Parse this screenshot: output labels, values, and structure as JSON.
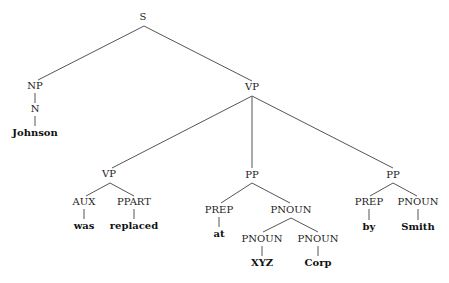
{
  "nodes": [
    {
      "id": "s",
      "label": "S",
      "x": 143,
      "y": 17,
      "type": "category"
    },
    {
      "id": "np",
      "label": "NP",
      "x": 35,
      "y": 86,
      "type": "category"
    },
    {
      "id": "n",
      "label": "N",
      "x": 35,
      "y": 109,
      "type": "category"
    },
    {
      "id": "johnson",
      "label": "Johnson",
      "x": 35,
      "y": 133,
      "type": "word"
    },
    {
      "id": "vp1",
      "label": "VP",
      "x": 252,
      "y": 87,
      "type": "category"
    },
    {
      "id": "vp2",
      "label": "VP",
      "x": 109,
      "y": 174,
      "type": "category"
    },
    {
      "id": "aux",
      "label": "AUX",
      "x": 84,
      "y": 202,
      "type": "category"
    },
    {
      "id": "was",
      "label": "was",
      "x": 84,
      "y": 226,
      "type": "word"
    },
    {
      "id": "ppart",
      "label": "PPART",
      "x": 134,
      "y": 202,
      "type": "category"
    },
    {
      "id": "replaced",
      "label": "replaced",
      "x": 134,
      "y": 226,
      "type": "word"
    },
    {
      "id": "pp1",
      "label": "PP",
      "x": 252,
      "y": 175,
      "type": "category"
    },
    {
      "id": "prep1",
      "label": "PREP",
      "x": 219,
      "y": 210,
      "type": "category"
    },
    {
      "id": "at",
      "label": "at",
      "x": 219,
      "y": 234,
      "type": "word"
    },
    {
      "id": "pnoun1",
      "label": "PNOUN",
      "x": 291,
      "y": 210,
      "type": "category"
    },
    {
      "id": "pnoun2",
      "label": "PNOUN",
      "x": 262,
      "y": 239,
      "type": "category"
    },
    {
      "id": "xyz",
      "label": "XYZ",
      "x": 262,
      "y": 263,
      "type": "word"
    },
    {
      "id": "pnoun3",
      "label": "PNOUN",
      "x": 318,
      "y": 239,
      "type": "category"
    },
    {
      "id": "corp",
      "label": "Corp",
      "x": 318,
      "y": 263,
      "type": "word"
    },
    {
      "id": "pp2",
      "label": "PP",
      "x": 393,
      "y": 175,
      "type": "category"
    },
    {
      "id": "prep2",
      "label": "PREP",
      "x": 369,
      "y": 202,
      "type": "category"
    },
    {
      "id": "by",
      "label": "by",
      "x": 369,
      "y": 227,
      "type": "word"
    },
    {
      "id": "pnoun4",
      "label": "PNOUN",
      "x": 418,
      "y": 202,
      "type": "category"
    },
    {
      "id": "smith",
      "label": "Smith",
      "x": 418,
      "y": 227,
      "type": "word"
    }
  ],
  "edges": [
    {
      "from": "s",
      "to": "np",
      "x1": 144,
      "y1": 26,
      "x2": 38,
      "y2": 80
    },
    {
      "from": "s",
      "to": "vp1",
      "x1": 144,
      "y1": 26,
      "x2": 252,
      "y2": 81
    },
    {
      "from": "np",
      "to": "n",
      "x1": 35,
      "y1": 93,
      "x2": 35,
      "y2": 103
    },
    {
      "from": "n",
      "to": "johnson",
      "x1": 35,
      "y1": 116,
      "x2": 35,
      "y2": 126
    },
    {
      "from": "vp1",
      "to": "vp2",
      "x1": 252,
      "y1": 96,
      "x2": 112,
      "y2": 168
    },
    {
      "from": "vp1",
      "to": "pp1",
      "x1": 252,
      "y1": 96,
      "x2": 252,
      "y2": 168
    },
    {
      "from": "vp1",
      "to": "pp2",
      "x1": 252,
      "y1": 96,
      "x2": 393,
      "y2": 168
    },
    {
      "from": "vp2",
      "to": "aux",
      "x1": 110,
      "y1": 183,
      "x2": 86,
      "y2": 196
    },
    {
      "from": "vp2",
      "to": "ppart",
      "x1": 110,
      "y1": 183,
      "x2": 134,
      "y2": 196
    },
    {
      "from": "aux",
      "to": "was",
      "x1": 84,
      "y1": 209,
      "x2": 84,
      "y2": 219
    },
    {
      "from": "ppart",
      "to": "replaced",
      "x1": 134,
      "y1": 209,
      "x2": 134,
      "y2": 219
    },
    {
      "from": "pp1",
      "to": "prep1",
      "x1": 252,
      "y1": 183,
      "x2": 221,
      "y2": 203
    },
    {
      "from": "pp1",
      "to": "pnoun1",
      "x1": 252,
      "y1": 183,
      "x2": 290,
      "y2": 203
    },
    {
      "from": "prep1",
      "to": "at",
      "x1": 219,
      "y1": 217,
      "x2": 219,
      "y2": 227
    },
    {
      "from": "pnoun1",
      "to": "pnoun2",
      "x1": 291,
      "y1": 218,
      "x2": 263,
      "y2": 232
    },
    {
      "from": "pnoun1",
      "to": "pnoun3",
      "x1": 291,
      "y1": 218,
      "x2": 318,
      "y2": 232
    },
    {
      "from": "pnoun2",
      "to": "xyz",
      "x1": 262,
      "y1": 246,
      "x2": 262,
      "y2": 256
    },
    {
      "from": "pnoun3",
      "to": "corp",
      "x1": 318,
      "y1": 246,
      "x2": 318,
      "y2": 256
    },
    {
      "from": "pp2",
      "to": "prep2",
      "x1": 393,
      "y1": 183,
      "x2": 370,
      "y2": 196
    },
    {
      "from": "pp2",
      "to": "pnoun4",
      "x1": 393,
      "y1": 183,
      "x2": 417,
      "y2": 196
    },
    {
      "from": "prep2",
      "to": "by",
      "x1": 369,
      "y1": 209,
      "x2": 369,
      "y2": 220
    },
    {
      "from": "pnoun4",
      "to": "smith",
      "x1": 418,
      "y1": 209,
      "x2": 418,
      "y2": 220
    }
  ]
}
